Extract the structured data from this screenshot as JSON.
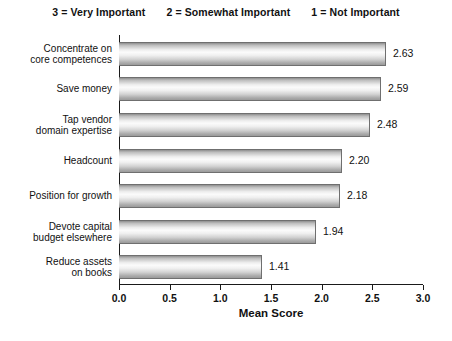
{
  "header": {
    "legend_entries": [
      "3 = Very Important",
      "2 = Somewhat Important",
      "1 = Not Important"
    ]
  },
  "chart_data": {
    "type": "bar",
    "orientation": "horizontal",
    "title": "",
    "xlabel": "Mean Score",
    "ylabel": "",
    "xlim": [
      0.0,
      3.0
    ],
    "xticks": [
      "0.0",
      "0.5",
      "1.0",
      "1.5",
      "2.0",
      "2.5",
      "3.0"
    ],
    "xtick_values": [
      0.0,
      0.5,
      1.0,
      1.5,
      2.0,
      2.5,
      3.0
    ],
    "grid": false,
    "legend": "none",
    "categories": [
      "Concentrate on core competences",
      "Save money",
      "Tap vendor domain expertise",
      "Headcount",
      "Position for growth",
      "Devote capital budget elsewhere",
      "Reduce assets on books"
    ],
    "category_lines": [
      [
        "Concentrate on",
        "core competences"
      ],
      [
        "Save money"
      ],
      [
        "Tap vendor",
        "domain expertise"
      ],
      [
        "Headcount"
      ],
      [
        "Position for growth"
      ],
      [
        "Devote capital",
        "budget elsewhere"
      ],
      [
        "Reduce assets",
        "on books"
      ]
    ],
    "values": [
      2.63,
      2.59,
      2.48,
      2.2,
      2.18,
      1.94,
      1.41
    ],
    "value_labels": [
      "2.63",
      "2.59",
      "2.48",
      "2.20",
      "2.18",
      "1.94",
      "1.41"
    ],
    "colors": {
      "bar_fill_light": "#fbfbfb",
      "bar_fill_dark": "#8e8e8e",
      "bar_border": "#6f6f6f",
      "axis": "#1a1a1a",
      "text": "#111111",
      "background": "#ffffff"
    }
  }
}
